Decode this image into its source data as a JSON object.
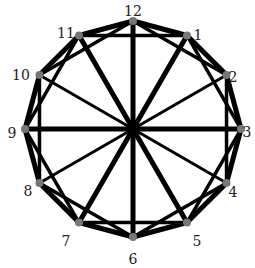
{
  "diagram": {
    "center": [
      133,
      129
    ],
    "radius": 108,
    "vertex_color": "#777777",
    "edge_color": "#000000",
    "vertices": [
      {
        "label": "12",
        "lx": 133,
        "ly": 12
      },
      {
        "label": "1",
        "lx": 198,
        "ly": 36
      },
      {
        "label": "2",
        "lx": 233,
        "ly": 78
      },
      {
        "label": "3",
        "lx": 247,
        "ly": 133
      },
      {
        "label": "4",
        "lx": 233,
        "ly": 193
      },
      {
        "label": "5",
        "lx": 197,
        "ly": 242
      },
      {
        "label": "6",
        "lx": 133,
        "ly": 260
      },
      {
        "label": "7",
        "lx": 66,
        "ly": 242
      },
      {
        "label": "8",
        "lx": 28,
        "ly": 192
      },
      {
        "label": "9",
        "lx": 12,
        "ly": 134
      },
      {
        "label": "10",
        "lx": 21,
        "ly": 76
      },
      {
        "label": "11",
        "lx": 66,
        "ly": 34
      }
    ],
    "thick_spokes": [
      0,
      3,
      6,
      9,
      11,
      5,
      1,
      7
    ],
    "thin_spokes": [
      2,
      8,
      4,
      10
    ]
  }
}
